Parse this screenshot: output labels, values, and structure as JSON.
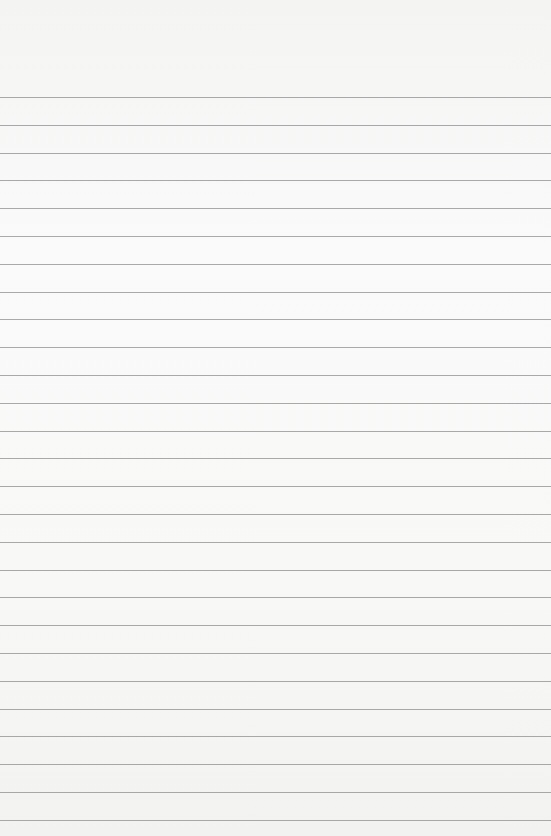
{
  "paper": {
    "type": "blank lined notebook paper",
    "background_color": "#f7f7f6",
    "line_color": "#8e8e8e",
    "first_line_y": 97,
    "line_spacing": 27.8,
    "line_count": 27
  }
}
